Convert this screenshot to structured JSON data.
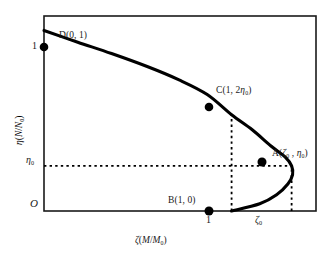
{
  "chart_data": {
    "type": "line",
    "title": "",
    "subtitle": "",
    "xlabel": "ζ(M/M₀)",
    "ylabel": "η(N/N₀)",
    "xlabel_parts": {
      "symbol": "ζ",
      "open": "(",
      "num": "M",
      "slash": "/",
      "den": "M",
      "den_sub": "0",
      "close": ")"
    },
    "ylabel_parts": {
      "symbol": "η",
      "open": "(",
      "num": "N",
      "slash": "/",
      "den": "N",
      "den_sub": "0",
      "close": ")"
    },
    "origin_label": "O",
    "grid": false,
    "legend": "none",
    "xlim": [
      0,
      1.45
    ],
    "ylim": [
      0,
      1.08
    ],
    "x_ticks": [
      {
        "value": 1.0,
        "label": "1"
      },
      {
        "value": 1.32,
        "label": "ζ₀",
        "symbol": "ζ",
        "sub": "0"
      }
    ],
    "y_ticks": [
      {
        "value": 1.0,
        "label": "1"
      },
      {
        "value": 0.25,
        "label": "η₀",
        "symbol": "η",
        "sub": "0"
      }
    ],
    "annotations": [
      {
        "name": "point-D",
        "label": "D(0, 1)",
        "x": 0.0,
        "y": 1.0,
        "marker": "filled-circle"
      },
      {
        "name": "point-C",
        "label": "C(1, 2η₀)",
        "x": 1.0,
        "y": 0.533,
        "marker": "filled-circle"
      },
      {
        "name": "point-A",
        "label": "A(ζ₀ , η₀)",
        "x": 1.32,
        "y": 0.25,
        "marker": "filled-circle"
      },
      {
        "name": "point-B",
        "label": "B(1, 0)",
        "x": 1.0,
        "y": 0.0,
        "marker": "filled-circle"
      }
    ],
    "series": [
      {
        "name": "eta-zeta-curve",
        "style": "solid",
        "color": "#000000",
        "points": [
          {
            "x": 0.0,
            "y": 1.0
          },
          {
            "x": 0.18,
            "y": 0.935
          },
          {
            "x": 0.36,
            "y": 0.872
          },
          {
            "x": 0.55,
            "y": 0.8
          },
          {
            "x": 0.72,
            "y": 0.726
          },
          {
            "x": 0.87,
            "y": 0.645
          },
          {
            "x": 1.0,
            "y": 0.533
          },
          {
            "x": 1.11,
            "y": 0.45
          },
          {
            "x": 1.21,
            "y": 0.36
          },
          {
            "x": 1.285,
            "y": 0.3
          },
          {
            "x": 1.32,
            "y": 0.25
          },
          {
            "x": 1.325,
            "y": 0.2
          },
          {
            "x": 1.3,
            "y": 0.15
          },
          {
            "x": 1.24,
            "y": 0.09
          },
          {
            "x": 1.15,
            "y": 0.04
          },
          {
            "x": 1.0,
            "y": 0.0
          }
        ]
      }
    ],
    "guide_lines": [
      {
        "name": "vertical-guide-at-C",
        "style": "dashed",
        "from": {
          "x": 1.0,
          "y": 0.0
        },
        "to": {
          "x": 1.0,
          "y": 0.533
        }
      },
      {
        "name": "horizontal-guide-at-A",
        "style": "dashed",
        "from": {
          "x": 0.0,
          "y": 0.25
        },
        "to": {
          "x": 1.32,
          "y": 0.25
        }
      },
      {
        "name": "vertical-guide-at-A",
        "style": "dashed",
        "from": {
          "x": 1.32,
          "y": 0.0
        },
        "to": {
          "x": 1.32,
          "y": 0.25
        }
      }
    ],
    "axes_box": {
      "color": "#1a1a1a",
      "left": true,
      "bottom": true,
      "top": true,
      "right": true
    }
  },
  "labels": {
    "point_d": "D(0, 1)",
    "point_c_prefix": "C(1, 2",
    "point_c_suffix": ")",
    "point_a_prefix": "A(",
    "point_a_mid": " , ",
    "point_a_suffix": ")",
    "point_b": "B(1, 0)",
    "y_tick_one": "1",
    "x_tick_one": "1",
    "origin": "O",
    "eta": "η",
    "zeta": "ζ",
    "zero_sub": "0",
    "m_symbol": "M",
    "n_symbol": "N",
    "slash": "/",
    "paren_open": "(",
    "paren_close": ")"
  }
}
